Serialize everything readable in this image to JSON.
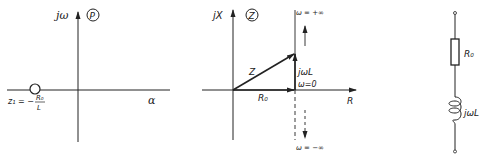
{
  "panels": {
    "pole_zero": {
      "marker": "P",
      "y_axis_label": "jω",
      "x_axis_label": "α",
      "zero_label_prefix": "z₁ = −",
      "zero_fraction_num": "R₀",
      "zero_fraction_den": "L"
    },
    "impedance": {
      "marker": "Z",
      "y_axis_label": "jX",
      "x_axis_label": "R",
      "vector_label": "Z",
      "real_label": "R₀",
      "imag_label": "jωL",
      "omega_zero_label": "ω=0",
      "omega_plus_label": "ω = +∞",
      "omega_minus_label": "ω = −∞"
    },
    "circuit": {
      "resistor_label": "R₀",
      "inductor_label": "jωL"
    }
  },
  "colors": {
    "ink": "#222222",
    "background": "#ffffff"
  }
}
